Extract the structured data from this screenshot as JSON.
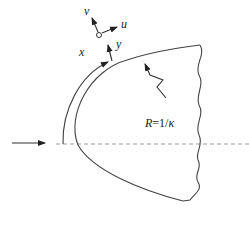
{
  "diagram": {
    "labels": {
      "v": "v",
      "u": "u",
      "x": "x",
      "y": "y",
      "radius_R": "R",
      "radius_eq": "=1/",
      "kappa": "κ"
    },
    "colors": {
      "stroke": "#444444",
      "dashed": "#999999",
      "background": "#ffffff"
    }
  }
}
